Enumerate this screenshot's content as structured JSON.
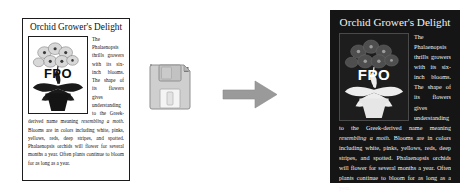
{
  "canvas": {
    "background": "#ffffff",
    "width": 472,
    "height": 194
  },
  "light_card": {
    "title": "Orchid Grower's Delight",
    "body_part1": "The Phalaenopsis thrills growers with its six-inch blooms. The shape of its flowers gives understanding to the Greek-derived name meaning ",
    "body_italic": "resembling a moth",
    "body_part2": ". Blooms are in colors including white, pinks, yellows, reds, deep stripes, and spotted. Phalaenopsis orchids will flower for several months a year. Often plants continue to bloom for as long as a year.",
    "fpo_label": "FPO",
    "background": "#ffffff",
    "text_color": "#111111",
    "border_color": "#1c1c1c"
  },
  "dark_card": {
    "title": "Orchid Grower's Delight",
    "body_part1": "The Phalaenopsis thrills growers with its six-inch blooms. The shape of its flowers gives understanding to the Greek-derived name meaning ",
    "body_italic": "resembling a moth",
    "body_part2": ". Blooms are in colors including white, pinks, yellows, reds, deep stripes, and spotted. Phalaenopsis orchids will flower for several months a year. Often plants continue to bloom for as long as a year.",
    "fpo_label": "FPO",
    "background": "#151515",
    "text_color": "#f2f2f2"
  },
  "icons": {
    "floppy_disk": "floppy-disk-icon",
    "arrow": "right-arrow-icon",
    "arrow_color": "#9a9a9a",
    "floppy_body_color": "#cfcfcf"
  }
}
